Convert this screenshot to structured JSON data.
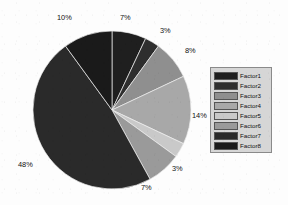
{
  "chart_data": {
    "type": "pie",
    "title": "",
    "categories": [
      "Factor1",
      "Factor2",
      "Factor3",
      "Factor4",
      "Factor5",
      "Factor6",
      "Factor7",
      "Factor8"
    ],
    "values": [
      7,
      3,
      8,
      14,
      3,
      7,
      48,
      10
    ],
    "value_labels": [
      "7%",
      "3%",
      "8%",
      "14%",
      "3%",
      "7%",
      "48%",
      "10%"
    ],
    "colors": [
      "#1f1f1f",
      "#2e2e2e",
      "#8f8f8f",
      "#a8a8a8",
      "#c9c9c9",
      "#9a9a9a",
      "#2a2a2a",
      "#1a1a1a"
    ],
    "legend_position": "right",
    "grid": false,
    "xlabel": "",
    "ylabel": "",
    "start_angle_deg": 0,
    "direction": "clockwise"
  },
  "legend": {
    "items": [
      {
        "label": "Factor1",
        "color": "#1f1f1f"
      },
      {
        "label": "Factor2",
        "color": "#2e2e2e"
      },
      {
        "label": "Factor3",
        "color": "#8f8f8f"
      },
      {
        "label": "Factor4",
        "color": "#a8a8a8"
      },
      {
        "label": "Factor5",
        "color": "#c9c9c9"
      },
      {
        "label": "Factor6",
        "color": "#9a9a9a"
      },
      {
        "label": "Factor7",
        "color": "#2a2a2a"
      },
      {
        "label": "Factor8",
        "color": "#1a1a1a"
      }
    ]
  },
  "labels": {
    "l0": "7%",
    "l1": "3%",
    "l2": "8%",
    "l3": "14%",
    "l4": "3%",
    "l5": "7%",
    "l6": "48%",
    "l7": "10%"
  }
}
